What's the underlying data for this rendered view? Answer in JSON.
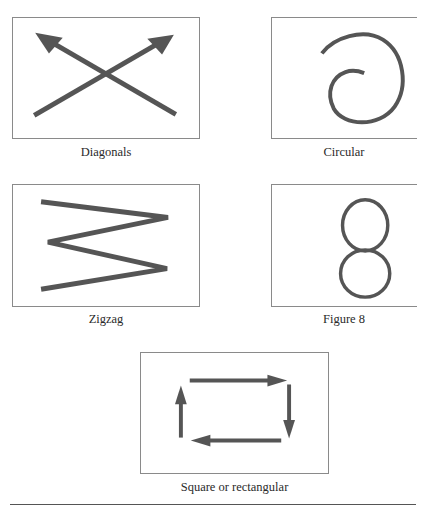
{
  "figure": {
    "panels": [
      {
        "id": "diagonals",
        "caption": "Diagonals",
        "pattern": "two crossing diagonal arrows pointing up-left and up-right"
      },
      {
        "id": "circular",
        "caption": "Circular",
        "pattern": "clockwise spiral"
      },
      {
        "id": "zigzag",
        "caption": "Zigzag",
        "pattern": "zigzag line"
      },
      {
        "id": "figure8",
        "caption": "Figure 8",
        "pattern": "figure-eight loop"
      },
      {
        "id": "square",
        "caption": "Square or rectangular",
        "pattern": "four arrows forming a clockwise rectangle"
      }
    ],
    "colors": {
      "stroke": "#555555",
      "border": "#8a8a8a",
      "background": "#ffffff"
    }
  }
}
